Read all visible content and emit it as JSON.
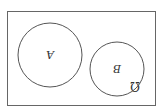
{
  "diagram": {
    "type": "venn",
    "orientation": "rotated-180",
    "universe_label": "Ω",
    "sets": [
      {
        "label": "A",
        "cx": 50,
        "cy": 55,
        "r": 32
      },
      {
        "label": "B",
        "cx": 117,
        "cy": 69,
        "r": 27
      }
    ],
    "relationship": "disjoint",
    "stroke_color": "#555555",
    "background": "#ffffff"
  }
}
